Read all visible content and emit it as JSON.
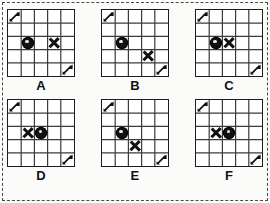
{
  "figure": {
    "grid_rows": 5,
    "grid_columns": 5,
    "border_style": "dashed",
    "colors": {
      "ink": "#111111",
      "grid_line": "#3a3a3a",
      "background": "#fbfbf9",
      "cell_fill": "#ffffff"
    },
    "token_glyphs": {
      "circle": "●",
      "cross": "✖",
      "arrow": "↗"
    }
  },
  "puzzles": [
    {
      "id": "A",
      "label": "A",
      "tokens": [
        {
          "name": "arrow-start",
          "type": "arrow",
          "row": 1,
          "col": 1
        },
        {
          "name": "circle",
          "type": "circle",
          "row": 3,
          "col": 2
        },
        {
          "name": "cross",
          "type": "cross",
          "row": 3,
          "col": 4
        },
        {
          "name": "arrow-end",
          "type": "arrow",
          "row": 5,
          "col": 5
        }
      ]
    },
    {
      "id": "B",
      "label": "B",
      "tokens": [
        {
          "name": "arrow-start",
          "type": "arrow",
          "row": 1,
          "col": 1
        },
        {
          "name": "circle",
          "type": "circle",
          "row": 3,
          "col": 2
        },
        {
          "name": "cross",
          "type": "cross",
          "row": 4,
          "col": 4
        },
        {
          "name": "arrow-end",
          "type": "arrow",
          "row": 5,
          "col": 5
        }
      ]
    },
    {
      "id": "C",
      "label": "C",
      "tokens": [
        {
          "name": "arrow-start",
          "type": "arrow",
          "row": 1,
          "col": 1
        },
        {
          "name": "circle",
          "type": "circle",
          "row": 3,
          "col": 2
        },
        {
          "name": "cross",
          "type": "cross",
          "row": 3,
          "col": 3
        },
        {
          "name": "arrow-end",
          "type": "arrow",
          "row": 5,
          "col": 5
        }
      ]
    },
    {
      "id": "D",
      "label": "D",
      "tokens": [
        {
          "name": "arrow-start",
          "type": "arrow",
          "row": 1,
          "col": 1
        },
        {
          "name": "cross",
          "type": "cross",
          "row": 3,
          "col": 2
        },
        {
          "name": "circle",
          "type": "circle",
          "row": 3,
          "col": 3
        },
        {
          "name": "arrow-end",
          "type": "arrow",
          "row": 5,
          "col": 5
        }
      ]
    },
    {
      "id": "E",
      "label": "E",
      "tokens": [
        {
          "name": "arrow-start",
          "type": "arrow",
          "row": 1,
          "col": 1
        },
        {
          "name": "circle",
          "type": "circle",
          "row": 3,
          "col": 2
        },
        {
          "name": "cross",
          "type": "cross",
          "row": 4,
          "col": 3
        },
        {
          "name": "arrow-end",
          "type": "arrow",
          "row": 5,
          "col": 5
        }
      ]
    },
    {
      "id": "F",
      "label": "F",
      "tokens": [
        {
          "name": "arrow-start",
          "type": "arrow",
          "row": 1,
          "col": 1
        },
        {
          "name": "cross",
          "type": "cross",
          "row": 3,
          "col": 2
        },
        {
          "name": "circle",
          "type": "circle",
          "row": 3,
          "col": 3
        },
        {
          "name": "arrow-end",
          "type": "arrow",
          "row": 5,
          "col": 5
        }
      ]
    }
  ],
  "layout": {
    "rows": [
      [
        "A",
        "B",
        "C"
      ],
      [
        "D",
        "E",
        "F"
      ]
    ]
  }
}
